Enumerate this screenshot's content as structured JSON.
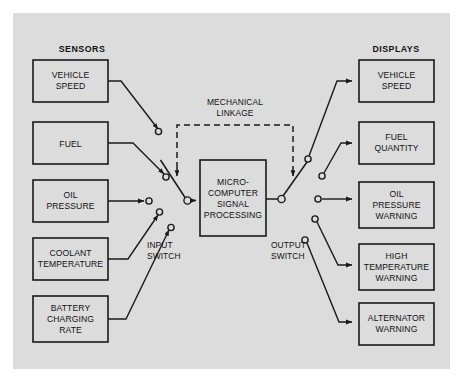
{
  "diagram": {
    "background_color": "#ffffff",
    "panel_color": "#dcdcdc",
    "line_color": "#1a1a1a",
    "headings": {
      "sensors": "SENSORS",
      "displays": "DISPLAYS"
    },
    "annotations": {
      "mechanical_linkage_line1": "MECHANICAL",
      "mechanical_linkage_line2": "LINKAGE",
      "input_switch_line1": "INPUT",
      "input_switch_line2": "SWITCH",
      "output_switch_line1": "OUTPUT",
      "output_switch_line2": "SWITCH"
    },
    "processor": {
      "line1": "MICRO-",
      "line2": "COMPUTER",
      "line3": "SIGNAL",
      "line4": "PROCESSING"
    },
    "sensors": [
      {
        "line1": "VEHICLE",
        "line2": "SPEED",
        "line3": ""
      },
      {
        "line1": "FUEL",
        "line2": "",
        "line3": ""
      },
      {
        "line1": "OIL",
        "line2": "PRESSURE",
        "line3": ""
      },
      {
        "line1": "COOLANT",
        "line2": "TEMPERATURE",
        "line3": ""
      },
      {
        "line1": "BATTERY",
        "line2": "CHARGING",
        "line3": "RATE"
      }
    ],
    "displays": [
      {
        "line1": "VEHICLE",
        "line2": "SPEED",
        "line3": ""
      },
      {
        "line1": "FUEL",
        "line2": "QUANTITY",
        "line3": ""
      },
      {
        "line1": "OIL",
        "line2": "PRESSURE",
        "line3": "WARNING"
      },
      {
        "line1": "HIGH",
        "line2": "TEMPERATURE",
        "line3": "WARNING"
      },
      {
        "line1": "ALTERNATOR",
        "line2": "WARNING",
        "line3": ""
      }
    ]
  }
}
